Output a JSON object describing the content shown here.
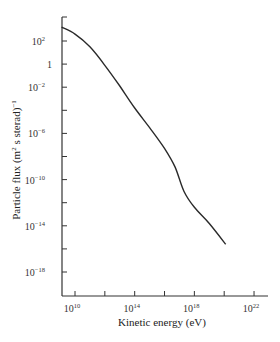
{
  "chart_data": {
    "type": "line",
    "title": "",
    "xlabel": "Kinetic energy (eV)",
    "ylabel": "Particle flux (m² s sterad)⁻¹",
    "xscale": "log",
    "yscale": "log",
    "xlim_log10": [
      9.1,
      22.9
    ],
    "ylim_log10": [
      -20.1,
      4.8
    ],
    "grid": false,
    "legend": null,
    "x_ticks": [
      {
        "exp": 10,
        "label": "10",
        "sup": "10"
      },
      {
        "exp": 12,
        "label": "",
        "sup": ""
      },
      {
        "exp": 14,
        "label": "10",
        "sup": "14"
      },
      {
        "exp": 16,
        "label": "",
        "sup": ""
      },
      {
        "exp": 18,
        "label": "10",
        "sup": "18"
      },
      {
        "exp": 20,
        "label": "",
        "sup": ""
      },
      {
        "exp": 22,
        "label": "10",
        "sup": "22"
      }
    ],
    "y_ticks": [
      {
        "exp": 2,
        "label": "10",
        "sup": "2"
      },
      {
        "exp": 0,
        "label": "1",
        "sup": ""
      },
      {
        "exp": -2,
        "label": "10",
        "sup": "−2"
      },
      {
        "exp": -4,
        "label": "",
        "sup": ""
      },
      {
        "exp": -6,
        "label": "10",
        "sup": "−6"
      },
      {
        "exp": -8,
        "label": "",
        "sup": ""
      },
      {
        "exp": -10,
        "label": "10",
        "sup": "−10"
      },
      {
        "exp": -12,
        "label": "",
        "sup": ""
      },
      {
        "exp": -14,
        "label": "10",
        "sup": "−14"
      },
      {
        "exp": -16,
        "label": "",
        "sup": ""
      },
      {
        "exp": -18,
        "label": "10",
        "sup": "−18"
      }
    ],
    "series": [
      {
        "name": "Cosmic-ray particle flux",
        "x_log10": [
          9.1,
          10.0,
          11.0,
          12.0,
          13.0,
          14.0,
          15.0,
          16.0,
          16.7,
          17.3,
          18.0,
          19.0,
          20.1
        ],
        "y_log10": [
          3.2,
          2.6,
          1.5,
          -0.1,
          -1.9,
          -3.8,
          -5.5,
          -7.3,
          -8.9,
          -11.0,
          -12.4,
          -13.8,
          -15.6
        ]
      }
    ]
  },
  "colors": {
    "background": "#ffffff",
    "line": "#2a2a2a",
    "axis": "#333333"
  }
}
